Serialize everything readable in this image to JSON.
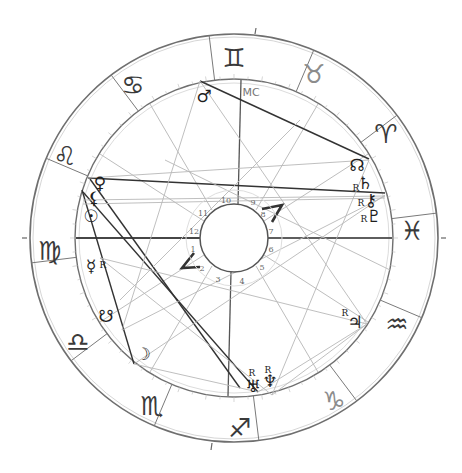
{
  "chart": {
    "center": [
      234,
      238
    ],
    "radius_outer": 204,
    "radius_zodiac_inner": 159,
    "radius_hub": 34,
    "radius_house_label": 42,
    "ring_color": "#6f6f6f",
    "aspect_dark": "#333333",
    "aspect_light": "#b8b8b8"
  },
  "zodiac": [
    {
      "name": "gemini",
      "glyph": "♊",
      "x": 234,
      "y": 58,
      "light": false
    },
    {
      "name": "taurus",
      "glyph": "♉",
      "x": 314,
      "y": 74,
      "light": true
    },
    {
      "name": "aries",
      "glyph": "♈",
      "x": 386,
      "y": 134,
      "light": false
    },
    {
      "name": "pisces",
      "glyph": "♓",
      "x": 412,
      "y": 231,
      "light": false
    },
    {
      "name": "aquarius",
      "glyph": "♒",
      "x": 397,
      "y": 324,
      "light": false
    },
    {
      "name": "capricorn",
      "glyph": "♑",
      "x": 334,
      "y": 401,
      "light": true
    },
    {
      "name": "sagittarius",
      "glyph": "♐",
      "x": 240,
      "y": 428,
      "light": false
    },
    {
      "name": "scorpio",
      "glyph": "♏",
      "x": 152,
      "y": 406,
      "light": false
    },
    {
      "name": "libra",
      "glyph": "♎",
      "x": 78,
      "y": 342,
      "light": false
    },
    {
      "name": "virgo",
      "glyph": "♍",
      "x": 50,
      "y": 251,
      "light": false
    },
    {
      "name": "leo",
      "glyph": "♌",
      "x": 65,
      "y": 156,
      "light": false
    },
    {
      "name": "cancer",
      "glyph": "♋",
      "x": 133,
      "y": 85,
      "light": false
    }
  ],
  "sign_cusp_angles": [
    7,
    37,
    67,
    97,
    127,
    157,
    187,
    217,
    247,
    277,
    307,
    337
  ],
  "planets": [
    {
      "name": "mars",
      "glyph": "♂",
      "x": 204,
      "y": 96,
      "retro": false
    },
    {
      "name": "north-node",
      "glyph": "☊",
      "x": 357,
      "y": 165,
      "retro": false
    },
    {
      "name": "saturn",
      "glyph": "♄",
      "x": 365,
      "y": 183,
      "retro": true,
      "rx": 356,
      "ry": 188
    },
    {
      "name": "chiron",
      "glyph": "⚷",
      "x": 371,
      "y": 200,
      "retro": true,
      "rx": 361,
      "ry": 203
    },
    {
      "name": "pluto",
      "glyph": "♇",
      "x": 374,
      "y": 216,
      "retro": true,
      "rx": 364,
      "ry": 219
    },
    {
      "name": "venus",
      "glyph": "♀",
      "x": 100,
      "y": 183,
      "retro": false
    },
    {
      "name": "lilith",
      "glyph": "⚸",
      "x": 94,
      "y": 198,
      "retro": false
    },
    {
      "name": "sun",
      "glyph": "☉",
      "x": 91,
      "y": 216,
      "retro": false
    },
    {
      "name": "mercury",
      "glyph": "☿",
      "x": 91,
      "y": 266,
      "retro": true,
      "rx": 103,
      "ry": 265
    },
    {
      "name": "south-node",
      "glyph": "☋",
      "x": 106,
      "y": 316,
      "retro": false
    },
    {
      "name": "moon",
      "glyph": "☽",
      "x": 143,
      "y": 354,
      "retro": false
    },
    {
      "name": "jupiter",
      "glyph": "♃",
      "x": 355,
      "y": 322,
      "retro": true,
      "rx": 345,
      "ry": 313
    },
    {
      "name": "uranus",
      "glyph": "♅",
      "x": 253,
      "y": 386,
      "retro": true,
      "rx": 252,
      "ry": 373
    },
    {
      "name": "neptune",
      "glyph": "♆",
      "x": 270,
      "y": 381,
      "retro": true,
      "rx": 268,
      "ry": 370
    }
  ],
  "retro_label": "R",
  "angles": [
    {
      "name": "midheaven",
      "label": "MC",
      "x": 251,
      "y": 92
    }
  ],
  "house_numbers": [
    {
      "n": "10",
      "x": 226,
      "y": 200
    },
    {
      "n": "9",
      "x": 253,
      "y": 202
    },
    {
      "n": "8",
      "x": 263,
      "y": 214
    },
    {
      "n": "7",
      "x": 271,
      "y": 231
    },
    {
      "n": "6",
      "x": 271,
      "y": 249
    },
    {
      "n": "5",
      "x": 262,
      "y": 267
    },
    {
      "n": "4",
      "x": 242,
      "y": 281
    },
    {
      "n": "3",
      "x": 218,
      "y": 279
    },
    {
      "n": "2",
      "x": 202,
      "y": 268
    },
    {
      "n": "1",
      "x": 193,
      "y": 249
    },
    {
      "n": "12",
      "x": 194,
      "y": 231
    },
    {
      "n": "11",
      "x": 203,
      "y": 213
    }
  ],
  "house_cusps": [
    {
      "x1": 241,
      "y1": 80,
      "x2": 238,
      "y2": 204,
      "dark": true
    },
    {
      "x1": 228,
      "y1": 396,
      "x2": 231,
      "y2": 272,
      "dark": true
    },
    {
      "x1": 76,
      "y1": 238,
      "x2": 200,
      "y2": 238,
      "dark": true
    },
    {
      "x1": 392,
      "y1": 238,
      "x2": 268,
      "y2": 238,
      "dark": false
    },
    {
      "x1": 150,
      "y1": 104,
      "x2": 212,
      "y2": 210,
      "dark": false
    },
    {
      "x1": 318,
      "y1": 104,
      "x2": 256,
      "y2": 210,
      "dark": false
    },
    {
      "x1": 100,
      "y1": 154,
      "x2": 204,
      "y2": 221,
      "dark": false
    },
    {
      "x1": 368,
      "y1": 322,
      "x2": 264,
      "y2": 255,
      "dark": false
    },
    {
      "x1": 100,
      "y1": 322,
      "x2": 204,
      "y2": 255,
      "dark": false
    },
    {
      "x1": 368,
      "y1": 154,
      "x2": 264,
      "y2": 221,
      "dark": false
    },
    {
      "x1": 150,
      "y1": 372,
      "x2": 212,
      "y2": 266,
      "dark": false
    },
    {
      "x1": 318,
      "y1": 372,
      "x2": 256,
      "y2": 266,
      "dark": false
    }
  ],
  "aspects": [
    {
      "x1": 200,
      "y1": 81,
      "x2": 369,
      "y2": 159,
      "dark": true
    },
    {
      "x1": 88,
      "y1": 178,
      "x2": 385,
      "y2": 193,
      "dark": true
    },
    {
      "x1": 82,
      "y1": 190,
      "x2": 134,
      "y2": 364,
      "dark": true
    },
    {
      "x1": 83,
      "y1": 192,
      "x2": 258,
      "y2": 392,
      "dark": true
    },
    {
      "x1": 90,
      "y1": 179,
      "x2": 240,
      "y2": 388,
      "dark": true
    },
    {
      "x1": 76,
      "y1": 238,
      "x2": 392,
      "y2": 238,
      "dark": true
    },
    {
      "x1": 134,
      "y1": 364,
      "x2": 385,
      "y2": 195,
      "dark": false
    },
    {
      "x1": 88,
      "y1": 178,
      "x2": 369,
      "y2": 160,
      "dark": false
    },
    {
      "x1": 83,
      "y1": 200,
      "x2": 385,
      "y2": 196,
      "dark": false
    },
    {
      "x1": 83,
      "y1": 204,
      "x2": 385,
      "y2": 198,
      "dark": false
    },
    {
      "x1": 200,
      "y1": 81,
      "x2": 367,
      "y2": 324,
      "dark": false
    },
    {
      "x1": 200,
      "y1": 81,
      "x2": 122,
      "y2": 330,
      "dark": false
    },
    {
      "x1": 258,
      "y1": 392,
      "x2": 367,
      "y2": 324,
      "dark": false
    },
    {
      "x1": 272,
      "y1": 395,
      "x2": 367,
      "y2": 324,
      "dark": false
    },
    {
      "x1": 272,
      "y1": 395,
      "x2": 369,
      "y2": 160,
      "dark": false
    },
    {
      "x1": 100,
      "y1": 258,
      "x2": 367,
      "y2": 324,
      "dark": false
    },
    {
      "x1": 100,
      "y1": 258,
      "x2": 272,
      "y2": 395,
      "dark": false
    },
    {
      "x1": 122,
      "y1": 330,
      "x2": 385,
      "y2": 196,
      "dark": false
    },
    {
      "x1": 134,
      "y1": 364,
      "x2": 258,
      "y2": 392,
      "dark": false
    },
    {
      "x1": 165,
      "y1": 160,
      "x2": 390,
      "y2": 270,
      "dark": false
    },
    {
      "x1": 120,
      "y1": 300,
      "x2": 300,
      "y2": 120,
      "dark": false
    }
  ],
  "aspect_glyphs": [
    {
      "name": "semisquare-aspect-right",
      "x": 274,
      "y": 217,
      "path": "M262,209 L282,205 L272,222"
    },
    {
      "name": "semisquare-aspect-left",
      "x": 191,
      "y": 262,
      "path": "M194,253 L182,268 L200,267"
    }
  ],
  "axis_ticks": [
    {
      "x1": 27,
      "y1": 238,
      "x2": 22,
      "y2": 238
    },
    {
      "x1": 441,
      "y1": 238,
      "x2": 446,
      "y2": 238
    },
    {
      "x1": 255,
      "y1": 34,
      "x2": 256,
      "y2": 28
    },
    {
      "x1": 212,
      "y1": 443,
      "x2": 211,
      "y2": 450
    }
  ]
}
